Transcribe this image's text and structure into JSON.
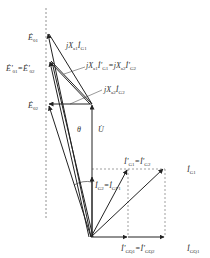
{
  "diagram": {
    "type": "phasor-diagram",
    "colors": {
      "line": "#222222",
      "dashed": "#777777",
      "text": "#333333"
    },
    "labels": {
      "E01": {
        "main": "Ė",
        "sub": "01"
      },
      "E01p_eq_E02p": {
        "main": "Ė'",
        "sub1": "01",
        "eq": "=Ė'",
        "sub2": "02"
      },
      "jXa1IG1": {
        "main": "jX",
        "sub": "a1",
        "cur": "İ",
        "cursub": "G1"
      },
      "jXa1IpG1_eq": {
        "main": "jX",
        "sub": "a1",
        "cur": "İ'",
        "cursub": "G1",
        "eq": "=jX",
        "sub2": "a2",
        "cur2": "İ'",
        "cursub2": "G2"
      },
      "jXa2IG2": {
        "main": "jX",
        "sub": "a2",
        "cur": "İ",
        "cursub": "G2"
      },
      "E02": {
        "main": "Ė",
        "sub": "02"
      },
      "theta": "θ",
      "U": "U̇",
      "IpG1_eq_IpG2": {
        "main": "İ'",
        "sub": "G1",
        "eq": "=İ'",
        "sub2": "G2"
      },
      "IG1": {
        "main": "İ",
        "sub": "G1"
      },
      "IG2_eq_IGP1": {
        "main": "İ",
        "sub": "G2",
        "eq": "=İ",
        "sub2": "GP1"
      },
      "IpGQ1_eq_IpGQ2": {
        "main": "İ'",
        "sub": "GQ1",
        "eq": "=İ'",
        "sub2": "GQ2"
      },
      "IGQ1": {
        "main": "İ",
        "sub": "GQ1"
      }
    }
  }
}
